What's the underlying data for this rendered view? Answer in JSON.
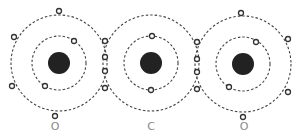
{
  "atoms": [
    {
      "symbol": "O",
      "label": "O",
      "cx": 59,
      "cy": 63
    },
    {
      "symbol": "C",
      "label": "C",
      "cx": 151,
      "cy": 63
    },
    {
      "symbol": "O",
      "label": "O",
      "cx": 244,
      "cy": 64
    }
  ],
  "colors": {
    "nucleus": "#222222",
    "shell": "#444444",
    "electron": "#333333",
    "label": "#888888"
  }
}
